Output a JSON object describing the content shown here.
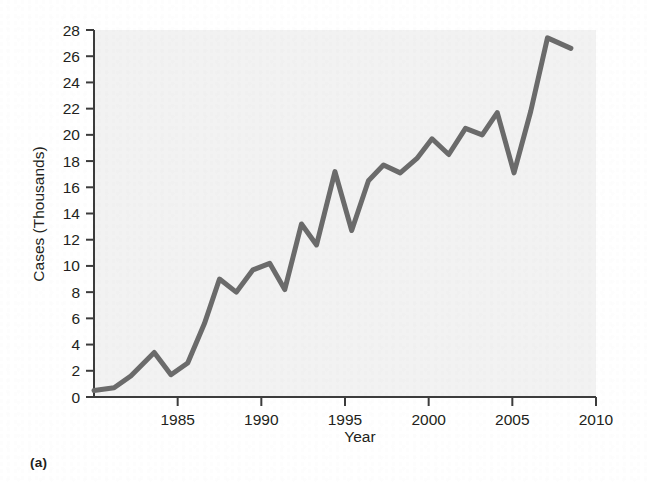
{
  "figure": {
    "panel_label": "(a)",
    "background_color": "#ffffff",
    "plot_background_color": "#f2f2f2",
    "line_color": "#6b6b6b",
    "axis_color": "#3c3c3c",
    "text_color": "#231f20"
  },
  "chart_data": {
    "type": "line",
    "title": "",
    "xlabel": "Year",
    "ylabel": "Cases (Thousands)",
    "xlim": [
      1980,
      2010
    ],
    "ylim": [
      0,
      28
    ],
    "xticks": [
      1985,
      1990,
      1995,
      2000,
      2005,
      2010
    ],
    "xtick_labels": [
      "1985",
      "1990",
      "1995",
      "2000",
      "2005",
      "2010"
    ],
    "yticks": [
      0,
      2,
      4,
      6,
      8,
      10,
      12,
      14,
      16,
      18,
      20,
      22,
      24,
      26,
      28
    ],
    "ytick_labels": [
      "0",
      "2",
      "4",
      "6",
      "8",
      "10",
      "12",
      "14",
      "16",
      "18",
      "20",
      "22",
      "24",
      "26",
      "28"
    ],
    "grid": false,
    "legend": false,
    "series": [
      {
        "name": "Cases",
        "x": [
          1980.0,
          1981.2,
          1982.2,
          1983.6,
          1984.6,
          1985.6,
          1986.6,
          1987.5,
          1988.5,
          1989.5,
          1990.5,
          1991.4,
          1992.4,
          1993.3,
          1994.4,
          1995.4,
          1996.4,
          1997.3,
          1998.3,
          1999.3,
          2000.2,
          2001.2,
          2002.2,
          2003.2,
          2004.1,
          2005.1,
          2006.1,
          2007.1,
          2008.5
        ],
        "y": [
          0.5,
          0.7,
          1.6,
          3.4,
          1.7,
          2.6,
          5.6,
          9.0,
          8.0,
          9.7,
          10.2,
          8.2,
          13.2,
          11.6,
          17.2,
          12.7,
          16.5,
          17.7,
          17.1,
          18.2,
          19.7,
          18.5,
          20.5,
          20.0,
          21.7,
          17.1,
          21.8,
          27.4,
          26.6
        ]
      }
    ]
  }
}
